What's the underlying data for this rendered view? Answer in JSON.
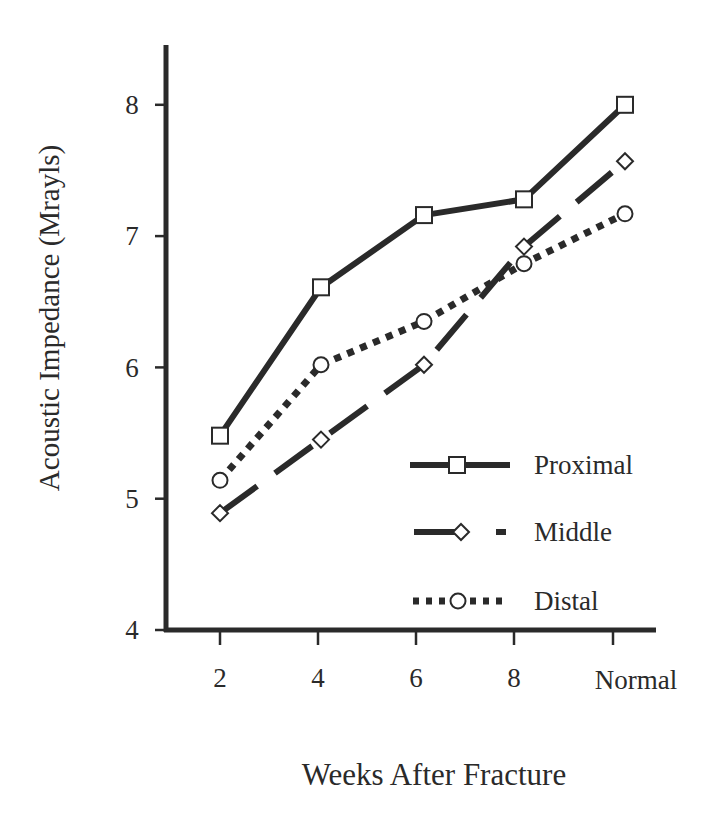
{
  "chart_data": {
    "type": "line",
    "title": "",
    "xlabel": "Weeks After Fracture",
    "ylabel": "Acoustic Impedance (Mrayls)",
    "categories": [
      "2",
      "4",
      "6",
      "8",
      "Normal"
    ],
    "ylim": [
      4,
      8.4
    ],
    "yticks": [
      4,
      5,
      6,
      7,
      8
    ],
    "grid": false,
    "legend_position": "lower right (inside plot)",
    "series": [
      {
        "name": "Proximal",
        "marker": "square",
        "line_style": "solid",
        "values": [
          5.48,
          6.61,
          7.16,
          7.28,
          8.0
        ]
      },
      {
        "name": "Middle",
        "marker": "diamond",
        "line_style": "long-dash",
        "values": [
          4.89,
          5.45,
          6.02,
          6.92,
          7.57
        ]
      },
      {
        "name": "Distal",
        "marker": "circle",
        "line_style": "dotted",
        "values": [
          5.14,
          6.02,
          6.35,
          6.79,
          7.17
        ]
      }
    ]
  },
  "axes": {
    "ylabel": "Acoustic Impedance (Mrayls)",
    "xlabel": "Weeks After Fracture",
    "yticks": [
      "4",
      "5",
      "6",
      "7",
      "8"
    ],
    "xticks": [
      "2",
      "4",
      "6",
      "8",
      "Normal"
    ]
  },
  "legend": [
    {
      "label": "Proximal"
    },
    {
      "label": "Middle"
    },
    {
      "label": "Distal"
    }
  ],
  "colors": {
    "ink": "#2a2a2a",
    "background": "#ffffff"
  }
}
